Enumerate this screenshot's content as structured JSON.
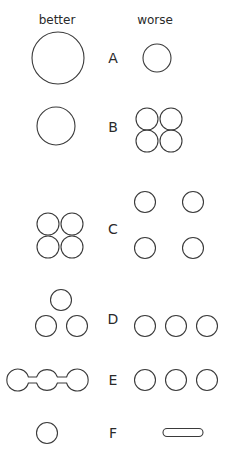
{
  "headers": {
    "left": "better",
    "right": "worse"
  },
  "rows": [
    {
      "label": "A",
      "better": "one large circle",
      "worse": "one small circle"
    },
    {
      "label": "B",
      "better": "one circle",
      "worse": "four touching circles in 2x2 grid"
    },
    {
      "label": "C",
      "better": "four touching circles in 2x2 grid",
      "worse": "four separated circles"
    },
    {
      "label": "D",
      "better": "three circles in triangle",
      "worse": "three circles in a row"
    },
    {
      "label": "E",
      "better": "three circles connected by bars",
      "worse": "three separate circles in a row"
    },
    {
      "label": "F",
      "better": "one circle",
      "worse": "elongated capsule"
    }
  ],
  "colors": {
    "stroke": "#3a3a3a",
    "background": "#ffffff"
  }
}
